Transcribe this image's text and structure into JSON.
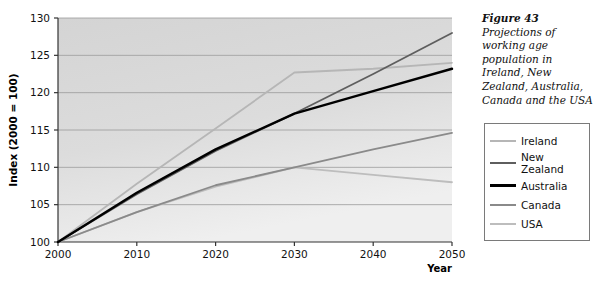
{
  "figure": {
    "title": "Figure 43",
    "caption": "Projections of working age population in Ireland, New Zealand, Australia, Canada and the USA"
  },
  "legend": {
    "items": [
      {
        "label": "Ireland",
        "color": "#b6b6b6"
      },
      {
        "label": "New Zealand",
        "color": "#5e5e5e"
      },
      {
        "label": "Australia",
        "color": "#000000"
      },
      {
        "label": "Canada",
        "color": "#8a8a8a"
      },
      {
        "label": "USA",
        "color": "#bdbdbd"
      }
    ]
  },
  "axes": {
    "y_label": "Index (2000 = 100)",
    "x_label": "Year",
    "y_ticks": [
      "100",
      "105",
      "110",
      "115",
      "120",
      "125",
      "130"
    ],
    "x_ticks": [
      "2000",
      "2010",
      "2020",
      "2030",
      "2040",
      "2050"
    ]
  },
  "chart_data": {
    "type": "line",
    "title": "Projections of working age population in Ireland, New Zealand, Australia, Canada and the USA",
    "xlabel": "Year",
    "ylabel": "Index (2000 = 100)",
    "xlim": [
      2000,
      2050
    ],
    "ylim": [
      100,
      130
    ],
    "grid": true,
    "legend_position": "right",
    "x": [
      2000,
      2010,
      2020,
      2030,
      2040,
      2050
    ],
    "series": [
      {
        "name": "Ireland",
        "color": "#b6b6b6",
        "values": [
          100,
          107.8,
          115.2,
          122.7,
          123.2,
          124.0
        ]
      },
      {
        "name": "New Zealand",
        "color": "#5e5e5e",
        "values": [
          100,
          106.4,
          112.2,
          117.2,
          122.5,
          128.0
        ]
      },
      {
        "name": "Australia",
        "color": "#000000",
        "values": [
          100,
          106.6,
          112.4,
          117.2,
          120.2,
          123.2
        ]
      },
      {
        "name": "Canada",
        "color": "#8a8a8a",
        "values": [
          100,
          104.0,
          107.6,
          110.0,
          112.4,
          114.6
        ]
      },
      {
        "name": "USA",
        "color": "#bdbdbd",
        "values": [
          100,
          104.0,
          107.4,
          110.0,
          109.0,
          108.0
        ]
      }
    ]
  },
  "plot_geometry": {
    "left": 58,
    "top": 18,
    "right": 452,
    "bottom": 242
  }
}
